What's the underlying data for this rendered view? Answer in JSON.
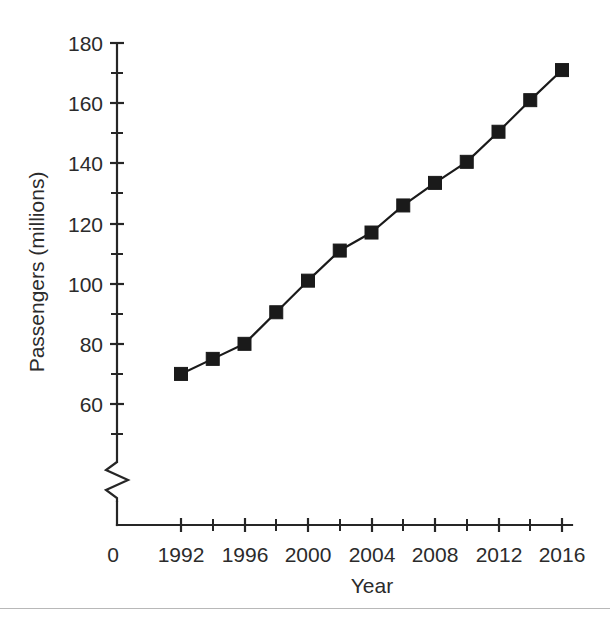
{
  "chart_data": {
    "type": "line",
    "title": "",
    "xlabel": "Year",
    "ylabel": "Passengers (millions)",
    "x": [
      1992,
      1994,
      1996,
      1998,
      2000,
      2002,
      2004,
      2006,
      2008,
      2010,
      2012,
      2014,
      2016
    ],
    "values": [
      70,
      75,
      80,
      90.5,
      101,
      111,
      117,
      126,
      133.5,
      140.5,
      150.5,
      161,
      171
    ],
    "series": [
      {
        "name": "Passengers",
        "values": [
          70,
          75,
          80,
          90.5,
          101,
          111,
          117,
          126,
          133.5,
          140.5,
          150.5,
          161,
          171
        ]
      }
    ],
    "xlim": [
      1991,
      2017
    ],
    "ylim": [
      50,
      180
    ],
    "x_major_ticks": [
      1992,
      1996,
      2000,
      2004,
      2008,
      2012,
      2016
    ],
    "x_minor_ticks": [
      1994,
      1998,
      2002,
      2006,
      2010,
      2014
    ],
    "x_tick_labels": [
      "1992",
      "1996",
      "2000",
      "2004",
      "2008",
      "2012",
      "2016"
    ],
    "x_origin_label": "0",
    "y_major_ticks": [
      60,
      80,
      100,
      120,
      140,
      160,
      180
    ],
    "y_minor_ticks": [
      50,
      70,
      90,
      110,
      130,
      150,
      170
    ],
    "y_tick_labels": [
      "60",
      "80",
      "100",
      "120",
      "140",
      "160",
      "180"
    ],
    "grid": false,
    "legend": false,
    "legend_position": "none",
    "axis_break": {
      "axis": "y",
      "symbol": "zigzag",
      "note": "y-axis broken below 50"
    },
    "marker": "filled-square",
    "line_color": "#1a1a1a",
    "marker_color": "#1a1a1a",
    "background_color": "#ffffff"
  },
  "figure": {
    "footer_rule_color": "#b8b8b8"
  }
}
